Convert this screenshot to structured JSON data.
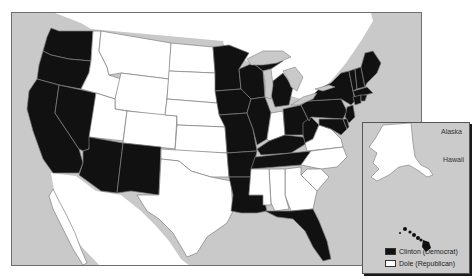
{
  "map": {
    "title": "",
    "type": "choropleth",
    "region": "United States",
    "colors": {
      "democrat": "#111111",
      "republican": "#ffffff",
      "water_and_foreign": "#c9c9c9",
      "border": "#777777"
    }
  },
  "inset": {
    "alaska_label": "Alaska",
    "hawaii_label": "Hawaii"
  },
  "legend": {
    "items": [
      {
        "label": "Clinton (Democrat)",
        "color": "#111111"
      },
      {
        "label": "Dole (Republican)",
        "color": "#ffffff"
      }
    ]
  },
  "states": {
    "democrat": [
      "WA",
      "OR",
      "CA",
      "NV",
      "AZ",
      "NM",
      "MN",
      "IA",
      "MO",
      "AR",
      "LA",
      "WI",
      "IL",
      "MI",
      "OH",
      "KY",
      "TN",
      "WV",
      "PA",
      "NY",
      "VT",
      "NH",
      "ME",
      "MA",
      "RI",
      "CT",
      "NJ",
      "DE",
      "MD",
      "FL",
      "HI"
    ],
    "republican": [
      "ID",
      "MT",
      "WY",
      "UT",
      "CO",
      "ND",
      "SD",
      "NE",
      "KS",
      "OK",
      "TX",
      "IN",
      "VA",
      "NC",
      "SC",
      "GA",
      "AL",
      "MS",
      "AK"
    ]
  }
}
